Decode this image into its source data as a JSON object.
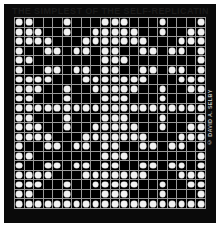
{
  "artwork": {
    "top_caption": "THE SIMPLEST OF THE SELF-REPLICATING PATTERNS",
    "side_credit": "© DAVID A. SELBY",
    "colors": {
      "page": "#ffffff",
      "frame": "#0a0a0a",
      "cell_off": "#000000",
      "dot": "#f2f2f2",
      "gridline": "#9a9a9a",
      "credit_text": "#b9b9b9"
    }
  },
  "chart_data": {
    "type": "heatmap",
    "title": "THE SIMPLEST OF THE SELF-REPLICATING PATTERNS",
    "xlabel": "",
    "ylabel": "",
    "grid": true,
    "legend": "none",
    "rows": 20,
    "cols": 20,
    "tile_rows": 10,
    "tile_cols": 10,
    "tiling": "2x2 repeat of the 10x10 motif",
    "value_meaning": {
      "1": "white dot on black cell",
      "0": "empty black cell"
    },
    "tile_values": [
      [
        1,
        1,
        0,
        0,
        0,
        1,
        0,
        0,
        0,
        1
      ],
      [
        1,
        1,
        1,
        0,
        0,
        1,
        0,
        0,
        1,
        1
      ],
      [
        1,
        1,
        1,
        1,
        0,
        0,
        0,
        1,
        1,
        1
      ],
      [
        1,
        0,
        0,
        1,
        1,
        0,
        1,
        1,
        0,
        1
      ],
      [
        1,
        1,
        0,
        0,
        0,
        0,
        0,
        0,
        0,
        1
      ],
      [
        1,
        0,
        0,
        1,
        1,
        0,
        1,
        1,
        0,
        1
      ],
      [
        1,
        1,
        1,
        1,
        0,
        0,
        0,
        1,
        1,
        1
      ],
      [
        1,
        1,
        1,
        0,
        0,
        1,
        0,
        0,
        1,
        1
      ],
      [
        1,
        1,
        0,
        0,
        0,
        1,
        0,
        0,
        0,
        1
      ],
      [
        1,
        1,
        1,
        1,
        1,
        1,
        1,
        1,
        1,
        1
      ]
    ],
    "values": [
      [
        1,
        1,
        0,
        0,
        0,
        1,
        0,
        0,
        0,
        1,
        1,
        1,
        0,
        0,
        0,
        1,
        0,
        0,
        0,
        1
      ],
      [
        1,
        1,
        1,
        0,
        0,
        1,
        0,
        0,
        1,
        1,
        1,
        1,
        1,
        0,
        0,
        1,
        0,
        0,
        1,
        1
      ],
      [
        1,
        1,
        1,
        1,
        0,
        0,
        0,
        1,
        1,
        1,
        1,
        1,
        1,
        1,
        0,
        0,
        0,
        1,
        1,
        1
      ],
      [
        1,
        0,
        0,
        1,
        1,
        0,
        1,
        1,
        0,
        1,
        1,
        0,
        0,
        1,
        1,
        0,
        1,
        1,
        0,
        1
      ],
      [
        1,
        1,
        0,
        0,
        0,
        0,
        0,
        0,
        0,
        1,
        1,
        1,
        0,
        0,
        0,
        0,
        0,
        0,
        0,
        1
      ],
      [
        1,
        0,
        0,
        1,
        1,
        0,
        1,
        1,
        0,
        1,
        1,
        0,
        0,
        1,
        1,
        0,
        1,
        1,
        0,
        1
      ],
      [
        1,
        1,
        1,
        1,
        0,
        0,
        0,
        1,
        1,
        1,
        1,
        1,
        1,
        1,
        0,
        0,
        0,
        1,
        1,
        1
      ],
      [
        1,
        1,
        1,
        0,
        0,
        1,
        0,
        0,
        1,
        1,
        1,
        1,
        1,
        0,
        0,
        1,
        0,
        0,
        1,
        1
      ],
      [
        1,
        1,
        0,
        0,
        0,
        1,
        0,
        0,
        0,
        1,
        1,
        1,
        0,
        0,
        0,
        1,
        0,
        0,
        0,
        1
      ],
      [
        1,
        1,
        1,
        1,
        1,
        1,
        1,
        1,
        1,
        1,
        1,
        1,
        1,
        1,
        1,
        1,
        1,
        1,
        1,
        1
      ],
      [
        1,
        1,
        0,
        0,
        0,
        1,
        0,
        0,
        0,
        1,
        1,
        1,
        0,
        0,
        0,
        1,
        0,
        0,
        0,
        1
      ],
      [
        1,
        1,
        1,
        0,
        0,
        1,
        0,
        0,
        1,
        1,
        1,
        1,
        1,
        0,
        0,
        1,
        0,
        0,
        1,
        1
      ],
      [
        1,
        1,
        1,
        1,
        0,
        0,
        0,
        1,
        1,
        1,
        1,
        1,
        1,
        1,
        0,
        0,
        0,
        1,
        1,
        1
      ],
      [
        1,
        0,
        0,
        1,
        1,
        0,
        1,
        1,
        0,
        1,
        1,
        0,
        0,
        1,
        1,
        0,
        1,
        1,
        0,
        1
      ],
      [
        1,
        1,
        0,
        0,
        0,
        0,
        0,
        0,
        0,
        1,
        1,
        1,
        0,
        0,
        0,
        0,
        0,
        0,
        0,
        1
      ],
      [
        1,
        0,
        0,
        1,
        1,
        0,
        1,
        1,
        0,
        1,
        1,
        0,
        0,
        1,
        1,
        0,
        1,
        1,
        0,
        1
      ],
      [
        1,
        1,
        1,
        1,
        0,
        0,
        0,
        1,
        1,
        1,
        1,
        1,
        1,
        1,
        0,
        0,
        0,
        1,
        1,
        1
      ],
      [
        1,
        1,
        1,
        0,
        0,
        1,
        0,
        0,
        1,
        1,
        1,
        1,
        1,
        0,
        0,
        1,
        0,
        0,
        1,
        1
      ],
      [
        1,
        1,
        0,
        0,
        0,
        1,
        0,
        0,
        0,
        1,
        1,
        1,
        0,
        0,
        0,
        1,
        0,
        0,
        0,
        1
      ],
      [
        1,
        1,
        1,
        1,
        1,
        1,
        1,
        1,
        1,
        1,
        1,
        1,
        1,
        1,
        1,
        1,
        1,
        1,
        1,
        1
      ]
    ]
  }
}
